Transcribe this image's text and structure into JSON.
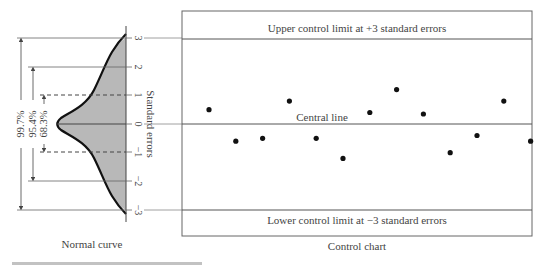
{
  "normal_curve": {
    "caption": "Normal curve",
    "axis_label": "Standard errors",
    "ticks": [
      "3",
      "2",
      "1",
      "0",
      "−1",
      "−2",
      "−3"
    ],
    "intervals": [
      {
        "label": "99.7%",
        "range": "±3"
      },
      {
        "label": "95.4%",
        "range": "±2"
      },
      {
        "label": "68.3%",
        "range": "±1"
      }
    ],
    "fill_color": "#b8b8b8"
  },
  "control_chart": {
    "caption": "Control chart",
    "upper_label": "Upper control limit at +3 standard errors",
    "central_label": "Central line",
    "lower_label": "Lower control limit at −3 standard errors"
  },
  "chart_data": {
    "type": "scatter",
    "title": "Control chart",
    "xlabel": "",
    "ylabel": "Standard errors",
    "ylim": [
      -3,
      3
    ],
    "reference_lines": [
      {
        "y": 3,
        "label": "Upper control limit at +3 standard errors"
      },
      {
        "y": 0,
        "label": "Central line"
      },
      {
        "y": -3,
        "label": "Lower control limit at −3 standard errors"
      }
    ],
    "x": [
      1,
      2,
      3,
      4,
      5,
      6,
      7,
      8,
      9,
      10,
      11,
      12,
      13
    ],
    "values": [
      0.5,
      -0.6,
      -0.5,
      0.8,
      -0.5,
      -1.2,
      0.4,
      1.2,
      0.35,
      -1.0,
      -0.4,
      0.8,
      -0.6
    ]
  }
}
